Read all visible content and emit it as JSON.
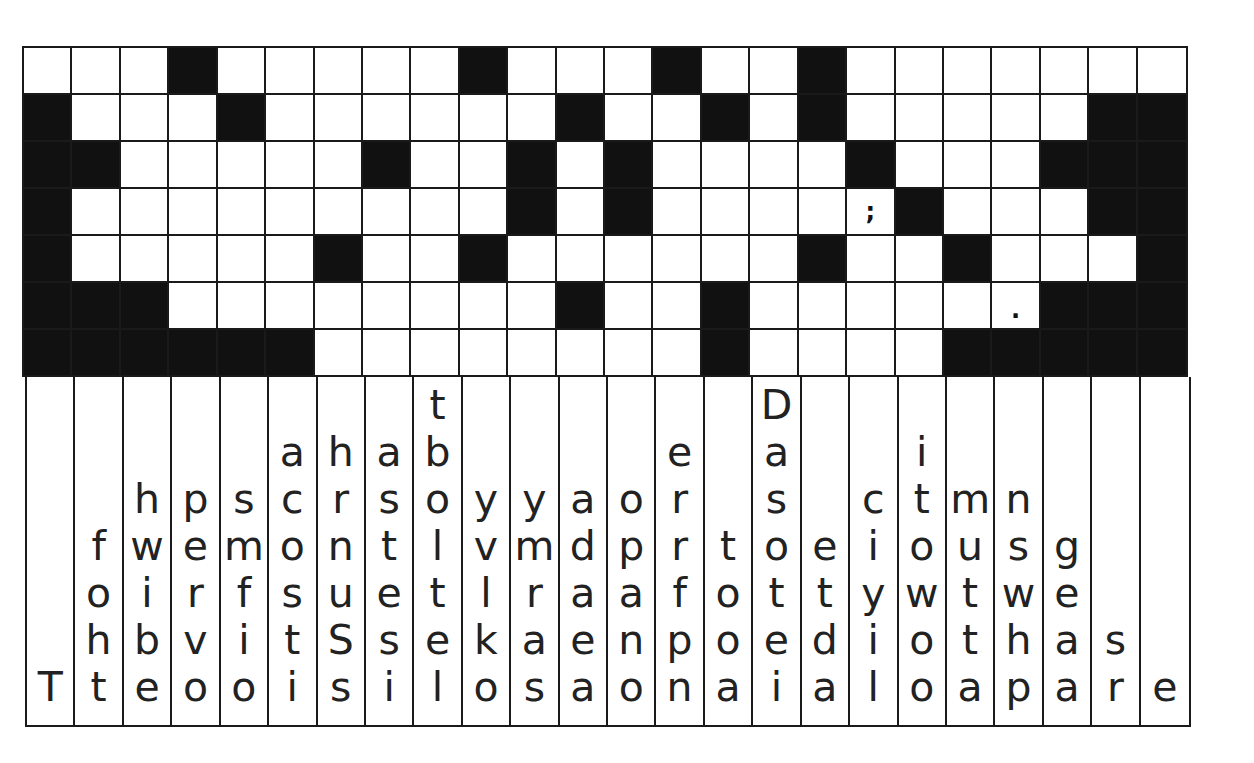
{
  "puzzle": {
    "type": "fallen-phrase",
    "rows": 7,
    "cols": 24,
    "grid": [
      ".,.,.,#,.,.,.,.,.,#,.,.,.,#,.,.,#,.,.,.,.,.,.,.",
      "#,.,.,.,#,.,.,.,.,.,.,#,.,.,#,.,#,.,.,.,.,.,#,#",
      "#,#,.,.,.,.,.,#,.,.,#,.,#,.,.,.,.,#,.,.,.,#,#,#",
      "#,.,.,.,.,.,.,.,.,.,#,.,#,.,.,.,.,;,#,.,.,.,#,#",
      "#,.,.,.,.,.,#,.,.,#,.,.,.,.,.,.,#,.,.,#,.,.,.,#",
      "#,#,#,.,.,.,.,.,.,.,.,#,.,.,#,.,.,.,.,.,dot,#,#,#",
      "#,#,#,#,#,#,.,.,.,.,.,.,.,.,#,.,.,.,.,#,#,#,#,#"
    ],
    "legend": {
      "#": "black",
      ".": "white",
      ";": "semicolon",
      "dot": "period"
    },
    "punctuation_glyphs": {
      "semicolon": ";",
      "period": "."
    },
    "letter_columns": [
      [
        "T"
      ],
      [
        "f",
        "o",
        "h",
        "t"
      ],
      [
        "h",
        "w",
        "i",
        "b",
        "e"
      ],
      [
        "p",
        "e",
        "r",
        "v",
        "o"
      ],
      [
        "s",
        "m",
        "f",
        "i",
        "o"
      ],
      [
        "a",
        "c",
        "o",
        "s",
        "t",
        "i"
      ],
      [
        "h",
        "r",
        "n",
        "u",
        "S",
        "s"
      ],
      [
        "a",
        "s",
        "t",
        "e",
        "s",
        "i"
      ],
      [
        "t",
        "b",
        "o",
        "l",
        "t",
        "e",
        "l"
      ],
      [
        "y",
        "v",
        "l",
        "k",
        "o"
      ],
      [
        "y",
        "m",
        "r",
        "a",
        "s"
      ],
      [
        "a",
        "d",
        "a",
        "e",
        "a"
      ],
      [
        "o",
        "p",
        "a",
        "n",
        "o"
      ],
      [
        "e",
        "r",
        "r",
        "f",
        "p",
        "n"
      ],
      [
        "t",
        "o",
        "o",
        "a"
      ],
      [
        "D",
        "a",
        "s",
        "o",
        "t",
        "e",
        "i"
      ],
      [
        "e",
        "t",
        "d",
        "a"
      ],
      [
        "c",
        "i",
        "y",
        "i",
        "l"
      ],
      [
        "i",
        "t",
        "o",
        "w",
        "o",
        "o"
      ],
      [
        "m",
        "u",
        "t",
        "t",
        "a"
      ],
      [
        "n",
        "s",
        "w",
        "h",
        "p"
      ],
      [
        "g",
        "e",
        "a",
        "a"
      ],
      [
        "s",
        "r"
      ],
      [
        "e"
      ]
    ]
  },
  "colors": {
    "black_cell": "#111111",
    "white_cell": "#ffffff",
    "line": "#1a1a1a",
    "letter": "#222222"
  }
}
